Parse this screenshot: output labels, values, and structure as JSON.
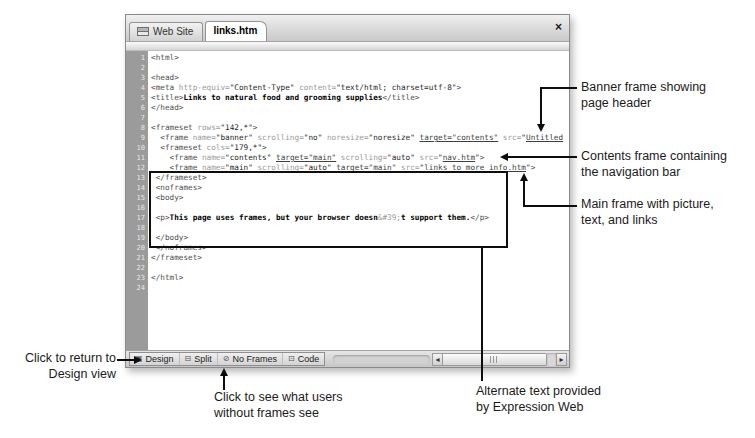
{
  "window": {
    "title_tabs": [
      {
        "label": "Web Site"
      },
      {
        "label": "links.htm"
      }
    ],
    "close_label": "×",
    "code_lines": [
      [
        [
          "t",
          "<html>"
        ]
      ],
      [],
      [
        [
          "t",
          "<head>"
        ]
      ],
      [
        [
          "t",
          "<meta"
        ],
        [
          "a",
          " http-equiv="
        ],
        [
          "v",
          "\"Content-Type\""
        ],
        [
          "a",
          " content="
        ],
        [
          "v",
          "\"text/html; charset=utf-8\""
        ],
        [
          "t",
          ">"
        ]
      ],
      [
        [
          "t",
          "<title>"
        ],
        [
          "b",
          "Links to natural food and grooming supplies"
        ],
        [
          "t",
          "</title>"
        ]
      ],
      [
        [
          "t",
          "</head>"
        ]
      ],
      [],
      [
        [
          "t",
          "<frameset"
        ],
        [
          "a",
          " rows="
        ],
        [
          "v",
          "\"142,*\""
        ],
        [
          "t",
          ">"
        ]
      ],
      [
        [
          "t",
          "  <frame"
        ],
        [
          "a",
          " name="
        ],
        [
          "v",
          "\"banner\""
        ],
        [
          "a",
          " scrolling="
        ],
        [
          "v",
          "\"no\""
        ],
        [
          "a",
          " noresize="
        ],
        [
          "v",
          "\"noresize\""
        ],
        [
          "a",
          " "
        ],
        [
          "l",
          "target=\"contents\""
        ],
        [
          "a",
          " src="
        ],
        [
          "v",
          "\""
        ],
        [
          "l",
          "Untitled"
        ]
      ],
      [
        [
          "t",
          "  <frameset"
        ],
        [
          "a",
          " cols="
        ],
        [
          "v",
          "\"179,*\""
        ],
        [
          "t",
          ">"
        ]
      ],
      [
        [
          "t",
          "    <frame"
        ],
        [
          "a",
          " name="
        ],
        [
          "v",
          "\"contents\""
        ],
        [
          "a",
          " "
        ],
        [
          "l",
          "target=\"main\""
        ],
        [
          "a",
          " scrolling="
        ],
        [
          "v",
          "\"auto\""
        ],
        [
          "a",
          " src="
        ],
        [
          "v",
          "\""
        ],
        [
          "l",
          "nav.htm"
        ],
        [
          "v",
          "\""
        ],
        [
          "t",
          ">"
        ]
      ],
      [
        [
          "t",
          "    <frame"
        ],
        [
          "a",
          " name="
        ],
        [
          "v",
          "\"main\""
        ],
        [
          "a",
          " scrolling="
        ],
        [
          "v",
          "\"auto\""
        ],
        [
          "a",
          " "
        ],
        [
          "l",
          "target=\"main\""
        ],
        [
          "a",
          " src="
        ],
        [
          "v",
          "\""
        ],
        [
          "l",
          "links to more info.htm"
        ],
        [
          "v",
          "\""
        ],
        [
          "t",
          ">"
        ]
      ],
      [
        [
          "t",
          " </frameset>"
        ]
      ],
      [
        [
          "t",
          " <noframes>"
        ]
      ],
      [
        [
          "t",
          " <body>"
        ]
      ],
      [],
      [
        [
          "t",
          " <p>"
        ],
        [
          "b",
          "This page uses frames, but your browser doesn"
        ],
        [
          "e",
          "&#39;"
        ],
        [
          "b",
          "t support them."
        ],
        [
          "t",
          "</p>"
        ]
      ],
      [],
      [
        [
          "t",
          " </body>"
        ]
      ],
      [
        [
          "t",
          " </noframes>"
        ]
      ],
      [
        [
          "t",
          "</frameset>"
        ]
      ],
      [],
      [
        [
          "t",
          "</html>"
        ]
      ],
      []
    ],
    "view_bar": {
      "buttons": [
        {
          "label": "Design",
          "icon": "▣"
        },
        {
          "label": "Split",
          "icon": "⊟"
        },
        {
          "label": "No Frames",
          "icon": "⊘"
        },
        {
          "label": "Code",
          "icon": "⊡"
        }
      ],
      "scroll_left": "◂",
      "scroll_right": "▸"
    }
  },
  "annotations": {
    "banner": {
      "lines": [
        "Banner frame showing",
        "page header"
      ]
    },
    "contents": {
      "lines": [
        "Contents frame containing",
        "the navigation bar"
      ]
    },
    "main_frame": {
      "lines": [
        "Main frame with picture,",
        "text, and links"
      ]
    },
    "design_view": {
      "lines": [
        "Click to return to",
        "Design view"
      ]
    },
    "no_frames": {
      "lines": [
        "Click to see what users",
        "without frames see"
      ]
    },
    "alt_text": {
      "lines": [
        "Alternate text provided",
        "by Expression Web"
      ]
    }
  },
  "colors": {
    "code_tag": "#4f4f4f",
    "code_attr_name": "#9a9a9a",
    "code_attr_value": "#1f1f1f",
    "code_bold_text": "#000000",
    "code_entity": "#9a9a9a",
    "code_link_underline": "#3f3f3f",
    "gutter_bg": "#9b9b9b",
    "gutter_number": "#e9e9e9",
    "callout_ink": "#0d0d0d"
  }
}
